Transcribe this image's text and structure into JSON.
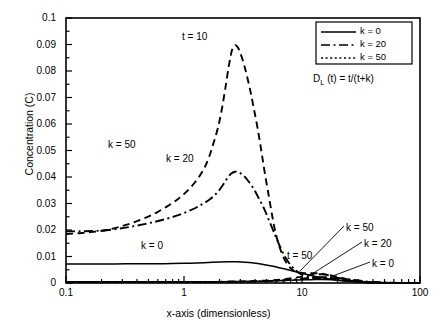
{
  "chart_data": {
    "type": "line",
    "title": "",
    "xlabel": "x-axis (dimensionless)",
    "ylabel": "Concentration (C)",
    "xscale": "log",
    "yscale": "linear",
    "xlim": [
      0.1,
      100
    ],
    "ylim": [
      0,
      0.1
    ],
    "xticks": [
      "0.1",
      "1",
      "10",
      "100"
    ],
    "yticks": [
      "0",
      "0.01",
      "0.02",
      "0.03",
      "0.04",
      "0.05",
      "0.06",
      "0.07",
      "0.08",
      "0.09",
      "0.1"
    ],
    "ytick_step": 0.01,
    "yminor_step": 0.005,
    "grid": false,
    "legend_position": "top-right",
    "equation": "D_L(t) = t/(t+k)",
    "equation_parts": {
      "symbol": "D",
      "subscript": "L",
      "rest": " (t) = t/(t+k)"
    },
    "legend": [
      {
        "label": "k = 0",
        "dash": "solid"
      },
      {
        "label": "k = 20",
        "dash": "dash-dot"
      },
      {
        "label": "k = 50",
        "dash": "dotted"
      }
    ],
    "annotations": [
      {
        "text": "t = 10",
        "x": 2.3,
        "y": 0.0955,
        "note": "above tall dashed peak"
      },
      {
        "text": "k = 50",
        "x": 0.85,
        "y": 0.0545,
        "note": "inline label on tall dashed curve"
      },
      {
        "text": "k = 20",
        "x": 2.0,
        "y": 0.0485,
        "note": "inline label on dash-dot curve"
      },
      {
        "text": "k = 0",
        "x": 1.1,
        "y": 0.0105,
        "note": "inline label on flat solid curve"
      },
      {
        "text": "t = 50",
        "x": 9.5,
        "y": 0.0075,
        "note": "label for low t=50 family"
      },
      {
        "text": "k = 50",
        "x": 33,
        "y": 0.0165,
        "leader_to": [
          14.5,
          0.0032
        ]
      },
      {
        "text": "k = 20",
        "x": 42,
        "y": 0.0118,
        "leader_to": [
          17.5,
          0.0022
        ]
      },
      {
        "text": "k = 0",
        "x": 46,
        "y": 0.0053,
        "leader_to": [
          22,
          0.0012
        ]
      }
    ],
    "series": [
      {
        "name": "t = 10, k = 0",
        "dash": "solid",
        "points": [
          [
            0.1,
            0.0072
          ],
          [
            0.15,
            0.0072
          ],
          [
            0.22,
            0.0072
          ],
          [
            0.32,
            0.00722
          ],
          [
            0.47,
            0.00725
          ],
          [
            0.68,
            0.0073
          ],
          [
            1.0,
            0.00742
          ],
          [
            1.3,
            0.00758
          ],
          [
            1.6,
            0.00775
          ],
          [
            2.0,
            0.00792
          ],
          [
            2.4,
            0.008
          ],
          [
            2.8,
            0.00798
          ],
          [
            3.3,
            0.00783
          ],
          [
            3.9,
            0.00752
          ],
          [
            4.6,
            0.00706
          ],
          [
            5.4,
            0.00648
          ],
          [
            6.4,
            0.00578
          ],
          [
            7.6,
            0.005
          ],
          [
            9.0,
            0.00418
          ],
          [
            10.6,
            0.00338
          ],
          [
            12.5,
            0.00262
          ],
          [
            14.8,
            0.00196
          ],
          [
            17.5,
            0.0014
          ],
          [
            20.7,
            0.00096
          ],
          [
            24.5,
            0.00062
          ],
          [
            29.0,
            0.00038
          ],
          [
            34.3,
            0.00022
          ],
          [
            40.6,
            0.00012
          ],
          [
            48.0,
            6e-05
          ],
          [
            57.0,
            3e-05
          ],
          [
            67.0,
            1e-05
          ],
          [
            80.0,
            5e-06
          ],
          [
            100,
            2e-06
          ]
        ]
      },
      {
        "name": "t = 10, k = 20",
        "dash": "dash-dot",
        "points": [
          [
            0.1,
            0.0195
          ],
          [
            0.13,
            0.0195
          ],
          [
            0.17,
            0.0196
          ],
          [
            0.22,
            0.0199
          ],
          [
            0.28,
            0.0205
          ],
          [
            0.36,
            0.0213
          ],
          [
            0.46,
            0.0222
          ],
          [
            0.58,
            0.0232
          ],
          [
            0.72,
            0.0243
          ],
          [
            0.88,
            0.0255
          ],
          [
            1.05,
            0.0268
          ],
          [
            1.25,
            0.0283
          ],
          [
            1.45,
            0.0299
          ],
          [
            1.68,
            0.0318
          ],
          [
            1.9,
            0.034
          ],
          [
            2.1,
            0.0365
          ],
          [
            2.3,
            0.0392
          ],
          [
            2.5,
            0.0412
          ],
          [
            2.7,
            0.042
          ],
          [
            2.9,
            0.0418
          ],
          [
            3.2,
            0.0405
          ],
          [
            3.5,
            0.0385
          ],
          [
            3.9,
            0.0355
          ],
          [
            4.3,
            0.032
          ],
          [
            4.8,
            0.0278
          ],
          [
            5.3,
            0.0232
          ],
          [
            5.9,
            0.0182
          ],
          [
            6.5,
            0.0138
          ],
          [
            7.2,
            0.0098
          ],
          [
            8.0,
            0.0068
          ],
          [
            8.9,
            0.0046
          ],
          [
            9.9,
            0.0032
          ],
          [
            11.0,
            0.0024
          ],
          [
            12.3,
            0.002
          ],
          [
            13.8,
            0.0019
          ],
          [
            15.5,
            0.0019
          ],
          [
            17.5,
            0.0018
          ],
          [
            20.0,
            0.0016
          ],
          [
            23.0,
            0.0012
          ],
          [
            26.5,
            0.0008
          ],
          [
            30.5,
            0.0005
          ],
          [
            35.5,
            0.0003
          ],
          [
            41.0,
            0.0002
          ],
          [
            48.0,
            0.0001
          ],
          [
            57.0,
            5e-05
          ],
          [
            70.0,
            2e-05
          ],
          [
            100,
            1e-05
          ]
        ]
      },
      {
        "name": "t = 10, k = 50",
        "dash": "dashed",
        "points": [
          [
            0.1,
            0.0185
          ],
          [
            0.13,
            0.0188
          ],
          [
            0.17,
            0.0193
          ],
          [
            0.22,
            0.02
          ],
          [
            0.28,
            0.0211
          ],
          [
            0.36,
            0.0226
          ],
          [
            0.46,
            0.0244
          ],
          [
            0.58,
            0.0265
          ],
          [
            0.72,
            0.0289
          ],
          [
            0.88,
            0.0315
          ],
          [
            1.05,
            0.0345
          ],
          [
            1.25,
            0.0382
          ],
          [
            1.45,
            0.0425
          ],
          [
            1.62,
            0.0472
          ],
          [
            1.78,
            0.0528
          ],
          [
            1.95,
            0.059
          ],
          [
            2.1,
            0.066
          ],
          [
            2.25,
            0.074
          ],
          [
            2.4,
            0.082
          ],
          [
            2.55,
            0.0878
          ],
          [
            2.7,
            0.0897
          ],
          [
            2.85,
            0.089
          ],
          [
            3.0,
            0.0868
          ],
          [
            3.2,
            0.083
          ],
          [
            3.4,
            0.0785
          ],
          [
            3.65,
            0.0725
          ],
          [
            3.9,
            0.066
          ],
          [
            4.2,
            0.0585
          ],
          [
            4.5,
            0.0505
          ],
          [
            4.8,
            0.0425
          ],
          [
            5.2,
            0.0335
          ],
          [
            5.6,
            0.0252
          ],
          [
            6.0,
            0.0185
          ],
          [
            6.5,
            0.0132
          ],
          [
            7.0,
            0.0095
          ],
          [
            7.6,
            0.0068
          ],
          [
            8.3,
            0.005
          ],
          [
            9.0,
            0.0042
          ],
          [
            10.0,
            0.0038
          ],
          [
            11.2,
            0.0037
          ],
          [
            12.5,
            0.0037
          ],
          [
            14.0,
            0.0036
          ],
          [
            15.5,
            0.0033
          ],
          [
            17.5,
            0.0027
          ],
          [
            19.5,
            0.002
          ],
          [
            22.0,
            0.0013
          ],
          [
            25.0,
            0.0008
          ],
          [
            28.5,
            0.0005
          ],
          [
            33.0,
            0.0003
          ],
          [
            38.0,
            0.0001
          ],
          [
            45.0,
            5e-05
          ],
          [
            55.0,
            2e-05
          ],
          [
            70.0,
            1e-05
          ],
          [
            100,
            5e-06
          ]
        ]
      },
      {
        "name": "t = 50, k = 0",
        "dash": "solid",
        "points": [
          [
            0.1,
            0.0005
          ],
          [
            0.3,
            0.0005
          ],
          [
            1.0,
            0.0005
          ],
          [
            2.0,
            0.0005
          ],
          [
            3.5,
            0.0006
          ],
          [
            5.0,
            0.0007
          ],
          [
            7.0,
            0.0009
          ],
          [
            9.0,
            0.0011
          ],
          [
            11.0,
            0.0012
          ],
          [
            13.0,
            0.0013
          ],
          [
            15.0,
            0.0013
          ],
          [
            18.0,
            0.0012
          ],
          [
            21.0,
            0.001
          ],
          [
            25.0,
            0.0008
          ],
          [
            30.0,
            0.0005
          ],
          [
            36.0,
            0.0003
          ],
          [
            44.0,
            0.0002
          ],
          [
            55.0,
            0.0001
          ],
          [
            70.0,
            5e-05
          ],
          [
            100,
            2e-05
          ]
        ]
      },
      {
        "name": "t = 50, k = 20",
        "dash": "dash-dot",
        "points": [
          [
            0.1,
            0.0004
          ],
          [
            0.5,
            0.0004
          ],
          [
            1.5,
            0.0004
          ],
          [
            3.0,
            0.0005
          ],
          [
            5.0,
            0.0007
          ],
          [
            7.0,
            0.001
          ],
          [
            9.0,
            0.0014
          ],
          [
            11.0,
            0.0018
          ],
          [
            13.0,
            0.0021
          ],
          [
            15.0,
            0.0022
          ],
          [
            17.0,
            0.0022
          ],
          [
            19.5,
            0.002
          ],
          [
            22.0,
            0.0017
          ],
          [
            26.0,
            0.0013
          ],
          [
            31.0,
            0.0009
          ],
          [
            37.0,
            0.0005
          ],
          [
            45.0,
            0.0003
          ],
          [
            56.0,
            0.0001
          ],
          [
            72.0,
            5e-05
          ],
          [
            100,
            2e-05
          ]
        ]
      },
      {
        "name": "t = 50, k = 50",
        "dash": "dashed",
        "points": [
          [
            0.1,
            0.0004
          ],
          [
            0.5,
            0.0004
          ],
          [
            1.5,
            0.0004
          ],
          [
            3.0,
            0.0006
          ],
          [
            5.0,
            0.0009
          ],
          [
            7.0,
            0.0014
          ],
          [
            8.5,
            0.0019
          ],
          [
            10.0,
            0.0024
          ],
          [
            11.5,
            0.0029
          ],
          [
            13.0,
            0.0032
          ],
          [
            14.5,
            0.0033
          ],
          [
            16.0,
            0.0032
          ],
          [
            18.0,
            0.0028
          ],
          [
            20.5,
            0.0022
          ],
          [
            23.0,
            0.0016
          ],
          [
            26.5,
            0.001
          ],
          [
            31.0,
            0.0006
          ],
          [
            37.0,
            0.0003
          ],
          [
            45.0,
            0.0001
          ],
          [
            58.0,
            5e-05
          ],
          [
            75.0,
            2e-05
          ],
          [
            100,
            1e-05
          ]
        ]
      }
    ]
  },
  "axes": {
    "x_title": "x-axis (dimensionless)",
    "y_title": "Concentration (C)",
    "x_tick_labels": [
      "0.1",
      "1",
      "10",
      "100"
    ],
    "y_tick_labels": [
      "0",
      "0.01",
      "0.02",
      "0.03",
      "0.04",
      "0.05",
      "0.06",
      "0.07",
      "0.08",
      "0.09",
      "0.1"
    ]
  },
  "legend": {
    "items": [
      "k = 0",
      "k = 20",
      "k = 50"
    ],
    "equation_symbol": "D",
    "equation_sub": "L",
    "equation_rest": " (t) = t/(t+k)"
  },
  "annotations": {
    "t10": "t = 10",
    "k50_inline": "k = 50",
    "k20_inline": "k = 20",
    "k0_inline": "k = 0",
    "t50": "t = 50",
    "k50_right": "k = 50",
    "k20_right": "k = 20",
    "k0_right": "k = 0"
  },
  "colors": {
    "background": "#ffffff",
    "ink": "#000000"
  }
}
